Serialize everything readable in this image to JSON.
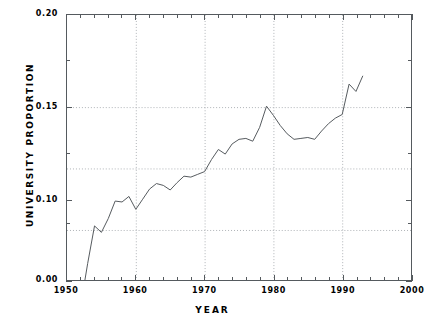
{
  "chart_data": {
    "type": "line",
    "title": "",
    "xlabel": "YEAR",
    "ylabel": "UNIVERSITY PROPORTION",
    "xlim": [
      1950,
      2000
    ],
    "ylim": [
      0.0,
      0.2
    ],
    "grid": true,
    "legend": null,
    "axis_note": "y-axis uses a broken scale: 0.00 sits at the plot floor, the plotted band runs from about 0.075 upward",
    "y_ticks_labeled": [
      "0.20",
      "0.15",
      "0.10",
      "0.00"
    ],
    "y_tick_values": [
      0.2,
      0.15,
      0.1,
      0.0
    ],
    "y_minor_ticks": [
      0.175,
      0.125,
      0.0875
    ],
    "x_ticks_labeled": [
      "1950",
      "1960",
      "1970",
      "1980",
      "1990",
      "2000"
    ],
    "x_tick_values": [
      1950,
      1960,
      1970,
      1980,
      1990,
      2000
    ],
    "x_minor_tick_step": 2,
    "gridline_values_y": [
      0.15,
      0.1167,
      0.0833
    ],
    "gridline_values_x": [
      1960,
      1970,
      1980,
      1990
    ],
    "line_color": "#555a5e",
    "series": [
      {
        "name": "University proportion",
        "x": [
          1951,
          1952,
          1953,
          1954,
          1955,
          1956,
          1957,
          1958,
          1959,
          1960,
          1961,
          1962,
          1963,
          1964,
          1965,
          1966,
          1967,
          1968,
          1969,
          1970,
          1971,
          1972,
          1973,
          1974,
          1975,
          1976,
          1977,
          1978,
          1979,
          1980,
          1981,
          1982,
          1983,
          1984,
          1985,
          1986,
          1987,
          1988,
          1989,
          1990,
          1991,
          1992,
          1993
        ],
        "values": [
          0.0,
          0.0425,
          0.065,
          0.0855,
          0.082,
          0.0895,
          0.099,
          0.0985,
          0.1015,
          0.0945,
          0.1,
          0.1055,
          0.1085,
          0.1075,
          0.105,
          0.109,
          0.1125,
          0.112,
          0.1135,
          0.115,
          0.1215,
          0.127,
          0.1245,
          0.13,
          0.1325,
          0.133,
          0.1315,
          0.139,
          0.1505,
          0.1455,
          0.14,
          0.1355,
          0.1325,
          0.133,
          0.1335,
          0.1325,
          0.137,
          0.141,
          0.144,
          0.146,
          0.1625,
          0.1585,
          0.167
        ]
      }
    ]
  },
  "axes": {
    "x_title": "YEAR",
    "y_title": "UNIVERSITY PROPORTION"
  }
}
